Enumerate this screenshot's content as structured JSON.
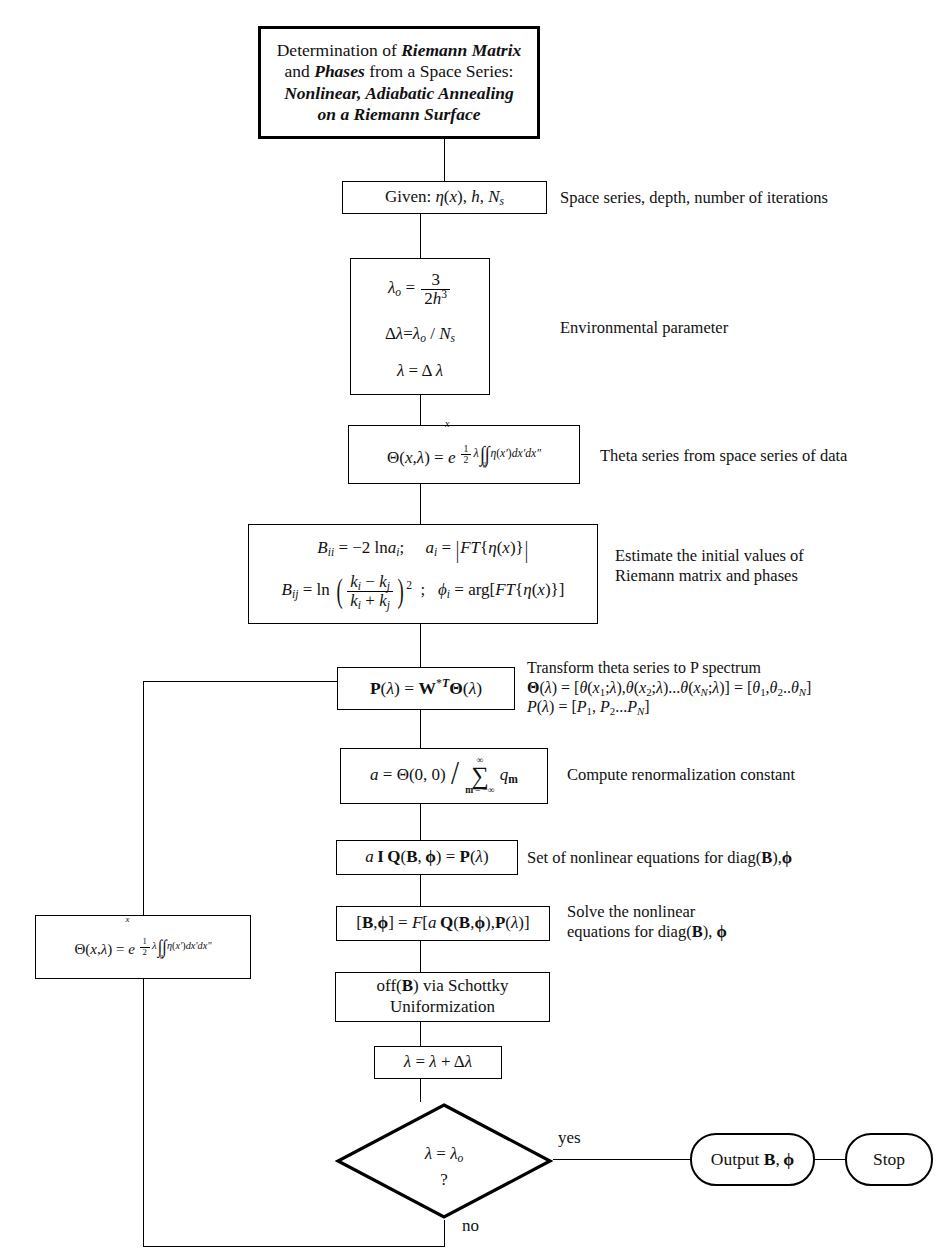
{
  "diagram": {
    "type": "flowchart",
    "title_block": {
      "line1_pre": "Determination of ",
      "line1_bold": "Riemann Matrix",
      "line2_pre": "and ",
      "line2_bold": "Phases",
      "line2_post": " from a Space Series:",
      "line3": "Nonlinear, Adiabatic Annealing",
      "line4": "on a Riemann Surface"
    },
    "nodes": {
      "given": {
        "label": "Given: η(x), h, Nₛ",
        "caption": "Space series, depth, number of iterations"
      },
      "environment": {
        "eq1": "λₒ = 3 / (2h³)",
        "eq2": "Δλ = λₒ / Nₛ",
        "eq3": "λ = Δλ",
        "caption": "Environmental parameter"
      },
      "theta": {
        "label": "Θ(x,λ) = e^{(1/2)λ ∫∫₀ˣ η(x')dx'dx''}",
        "caption": "Theta series from space series of data"
      },
      "riemann": {
        "eq1": "Bᵢᵢ = −2 ln aᵢ;   aᵢ = |FT{η(x)}|",
        "eq2": "Bᵢⱼ = ln((kᵢ − kⱼ)/(kᵢ + kⱼ))² ;   φᵢ = arg[FT{η(x)}]",
        "caption_line1": "Estimate the initial values of",
        "caption_line2": "Riemann matrix and phases"
      },
      "pspectrum": {
        "label": "P(λ) = W*ᵀΘ(λ)",
        "caption_line1": "Transform theta series to P spectrum",
        "caption_line2": "Θ(λ) = [θ(x₁;λ),θ(x₂;λ)...θ(xₙ;λ)] = [θ₁,θ₂..θₙ]",
        "caption_line3": "P(λ) = [P₁, P₂...Pₙ]"
      },
      "renormalization": {
        "label": "a = Θ(0, 0) / Σₘ₌₋∞ⁿ∞ qₘ",
        "caption": "Compute renormalization constant"
      },
      "nonlinear_equations": {
        "label": "a I Q(B, φ) = P(λ)",
        "caption": "Set of nonlinear equations for diag(B),φ"
      },
      "solve": {
        "label": "[B,φ] = F[a Q(B,φ),P(λ)]",
        "caption_line1": "Solve the nonlinear",
        "caption_line2": "equations for diag(B), φ"
      },
      "schottky": {
        "line1_pre": "off(",
        "line1_bold": "B",
        "line1_post": ") via Schottky",
        "line2": "Uniformization"
      },
      "lambda_update": {
        "label": "λ = λ + Δλ"
      },
      "theta_loop": {
        "label": "Θ(x,λ) = e^{(1/2)λ ∫∫₀ˣ η(x')dx'dx''}"
      },
      "decision": {
        "line1": "λ = λₒ",
        "line2": "?"
      },
      "output": {
        "label": "Output B, φ"
      },
      "stop": {
        "label": "Stop"
      }
    },
    "edge_labels": {
      "yes": "yes",
      "no": "no"
    },
    "colors": {
      "stroke": "#000000",
      "background": "#ffffff",
      "text": "#111111"
    }
  }
}
